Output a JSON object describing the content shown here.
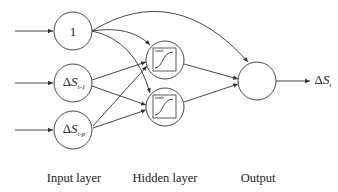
{
  "diagram": {
    "type": "neural-network",
    "input_nodes": [
      {
        "id": "bias",
        "symbol": "",
        "main": "1",
        "subscript": ""
      },
      {
        "id": "lag1",
        "symbol": "Δ",
        "main": "S",
        "subscript": "t-1"
      },
      {
        "id": "lagp",
        "symbol": "Δ",
        "main": "S",
        "subscript": "t-p"
      }
    ],
    "hidden_nodes": [
      {
        "id": "h1",
        "activation": "tanh"
      },
      {
        "id": "h2",
        "activation": "tanh"
      }
    ],
    "output_node": {
      "id": "out",
      "label_symbol": "Δ",
      "label_main": "S",
      "label_subscript": "t"
    },
    "layers": {
      "input": "Input layer",
      "hidden": "Hidden layer",
      "output": "Output"
    },
    "colors": {
      "stroke": "#333333",
      "background": "#ffffff"
    }
  }
}
